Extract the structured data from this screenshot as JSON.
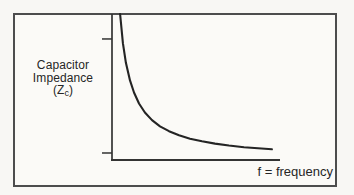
{
  "figure": {
    "ylabel_line1": "Capacitor",
    "ylabel_line2": "Impedance",
    "ylabel_line3_open": "(Z",
    "ylabel_line3_sub": "c",
    "ylabel_line3_close": ")",
    "xlabel": "f = frequency"
  },
  "colors": {
    "border": "#4d4d4d",
    "axis": "#333333",
    "curve": "#242424",
    "text": "#262626",
    "frame_background": "#fbfaf7",
    "page_background": "#f8f7f4"
  },
  "chart_data": {
    "type": "line",
    "title": "",
    "xlabel": "f = frequency",
    "ylabel": "Capacitor Impedance (Zc)",
    "relationship": "Zc is inversely proportional to frequency (Zc = 1/(2πfC)); curve falls hyperbolically from very high impedance at low f toward zero at high f",
    "grid": false,
    "legend": null,
    "x_axis": {
      "label": "f = frequency",
      "tick_labels": [],
      "range_norm": [
        0,
        1
      ]
    },
    "y_axis": {
      "label": "Capacitor Impedance (Zc)",
      "tick_labels": [],
      "ticks_norm": [
        0.829,
        0.048
      ],
      "range_norm": [
        0,
        1
      ]
    },
    "series": [
      {
        "name": "Capacitor impedance Zc vs frequency",
        "points_norm": [
          [
            0.048,
            1.0
          ],
          [
            0.065,
            0.8
          ],
          [
            0.083,
            0.666
          ],
          [
            0.107,
            0.545
          ],
          [
            0.131,
            0.462
          ],
          [
            0.161,
            0.387
          ],
          [
            0.196,
            0.325
          ],
          [
            0.238,
            0.273
          ],
          [
            0.286,
            0.231
          ],
          [
            0.339,
            0.197
          ],
          [
            0.399,
            0.169
          ],
          [
            0.464,
            0.146
          ],
          [
            0.536,
            0.128
          ],
          [
            0.613,
            0.112
          ],
          [
            0.696,
            0.099
          ],
          [
            0.786,
            0.088
          ],
          [
            0.869,
            0.08
          ],
          [
            0.952,
            0.073
          ]
        ]
      }
    ]
  }
}
